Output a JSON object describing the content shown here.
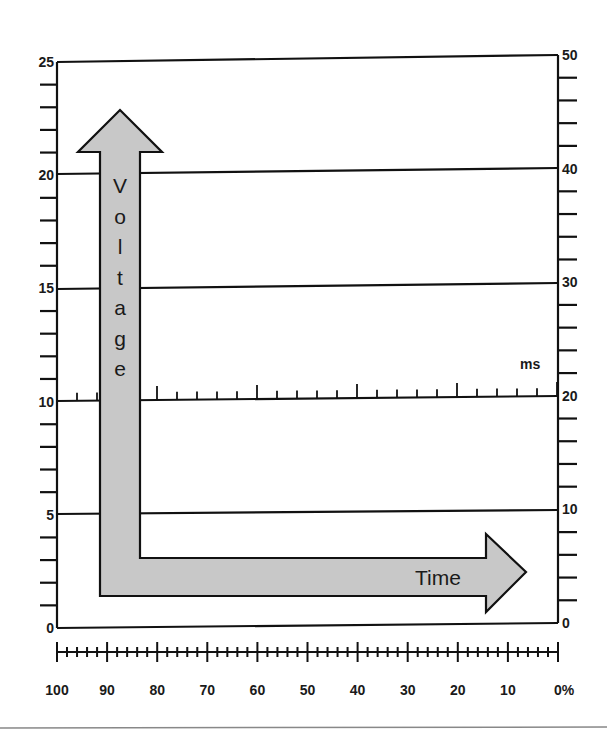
{
  "diagram": {
    "left_axis": {
      "name": "voltage-scale",
      "min": 0,
      "max": 25,
      "major_step": 5,
      "minor_per_major": 5,
      "tick_labels": [
        "0",
        "5",
        "10",
        "15",
        "20",
        "25"
      ]
    },
    "right_axis": {
      "name": "right-scale",
      "min": 0,
      "max": 50,
      "major_step": 10,
      "minor_per_major": 5,
      "tick_labels": [
        "0",
        "10",
        "20",
        "30",
        "40",
        "50"
      ]
    },
    "bottom_ruler": {
      "name": "percent-scale",
      "tick_labels": [
        "100",
        "90",
        "80",
        "70",
        "60",
        "50",
        "40",
        "30",
        "20",
        "10",
        "0%"
      ]
    },
    "gridlines_at_left_values": [
      5,
      10,
      15,
      20,
      25
    ],
    "time_baseline": {
      "unit_label": "ms",
      "at_left_value": 10,
      "minor_ticks": 4,
      "major_every": 5
    },
    "vertical_arrow": {
      "label_letters": [
        "V",
        "o",
        "l",
        "t",
        "a",
        "g",
        "e"
      ],
      "label": "Voltage"
    },
    "horizontal_arrow": {
      "label": "Time"
    },
    "colors": {
      "arrow_fill": "#c8c8c8",
      "line": "#111111",
      "background": "#ffffff",
      "separator": "#888888"
    }
  }
}
